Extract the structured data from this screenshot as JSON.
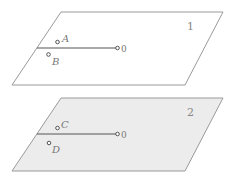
{
  "figure": {
    "panels": [
      {
        "id": "1",
        "number_label": "1",
        "shading": "white",
        "endpoint_label": "0",
        "points": [
          {
            "label": "A",
            "side": "above"
          },
          {
            "label": "B",
            "side": "below"
          }
        ]
      },
      {
        "id": "2",
        "number_label": "2",
        "shading": "gray",
        "endpoint_label": "0",
        "points": [
          {
            "label": "C",
            "side": "above"
          },
          {
            "label": "D",
            "side": "below"
          }
        ]
      }
    ]
  }
}
